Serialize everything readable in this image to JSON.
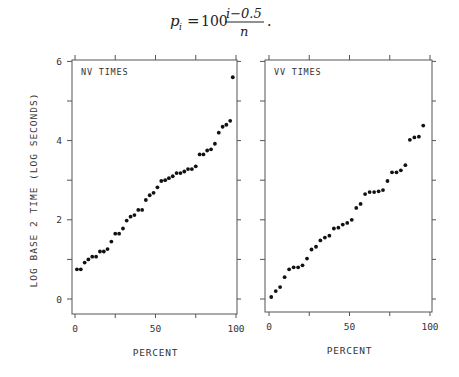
{
  "formula": {
    "lhs": "p",
    "lhs_sub": "i",
    "equals": "=",
    "coef": "100",
    "numerator": "i−0.5",
    "denominator": "n",
    "trailing": "."
  },
  "chart_data": [
    {
      "type": "scatter",
      "title": "NV TIMES",
      "xlabel": "PERCENT",
      "ylabel": "LOG BASE 2 TIME (LOG SECONDS)",
      "xlim": [
        0,
        100
      ],
      "ylim": [
        -0.4,
        6
      ],
      "xticks": [
        0,
        50,
        100
      ],
      "yticks": [
        0,
        2,
        4,
        6
      ],
      "grid": false,
      "legend": null,
      "x": [
        1.2,
        3.6,
        6.0,
        8.3,
        10.7,
        13.1,
        15.5,
        17.9,
        20.2,
        22.6,
        25.0,
        27.4,
        29.8,
        32.1,
        34.5,
        36.9,
        39.3,
        41.7,
        44.0,
        46.4,
        48.8,
        51.2,
        53.6,
        56.0,
        58.3,
        60.7,
        63.1,
        65.5,
        67.9,
        70.2,
        72.6,
        75.0,
        77.4,
        79.8,
        82.1,
        84.5,
        86.9,
        89.3,
        91.7,
        94.0,
        96.4
      ],
      "y": [
        0.75,
        0.75,
        0.92,
        1.0,
        1.07,
        1.07,
        1.2,
        1.2,
        1.26,
        1.45,
        1.65,
        1.65,
        1.78,
        1.98,
        2.08,
        2.12,
        2.25,
        2.25,
        2.5,
        2.62,
        2.68,
        2.82,
        2.98,
        3.0,
        3.05,
        3.1,
        3.18,
        3.18,
        3.22,
        3.28,
        3.28,
        3.35,
        3.65,
        3.65,
        3.75,
        3.78,
        3.92,
        4.2,
        4.35,
        4.4,
        4.5,
        5.6
      ]
    },
    {
      "type": "scatter",
      "title": "VV TIMES",
      "xlabel": "PERCENT",
      "ylabel": "",
      "xlim": [
        0,
        100
      ],
      "ylim": [
        -0.4,
        6
      ],
      "xticks": [
        0,
        50,
        100
      ],
      "yticks": [
        0,
        2,
        4,
        6
      ],
      "grid": false,
      "legend": null,
      "x": [
        1.4,
        4.2,
        6.9,
        9.7,
        12.5,
        15.3,
        18.1,
        20.8,
        23.6,
        26.4,
        29.2,
        31.9,
        34.7,
        37.5,
        40.3,
        43.1,
        45.8,
        48.6,
        51.4,
        54.2,
        56.9,
        59.7,
        62.5,
        65.3,
        68.1,
        70.8,
        73.6,
        76.4,
        79.2,
        81.9,
        84.7,
        87.5,
        90.3,
        93.1,
        95.8
      ],
      "y": [
        0.05,
        0.2,
        0.3,
        0.55,
        0.75,
        0.8,
        0.8,
        0.85,
        1.02,
        1.25,
        1.32,
        1.48,
        1.55,
        1.6,
        1.78,
        1.8,
        1.88,
        1.92,
        2.0,
        2.3,
        2.4,
        2.65,
        2.7,
        2.7,
        2.72,
        2.75,
        2.98,
        3.2,
        3.2,
        3.25,
        3.38,
        4.02,
        4.08,
        4.1,
        4.38
      ]
    }
  ]
}
